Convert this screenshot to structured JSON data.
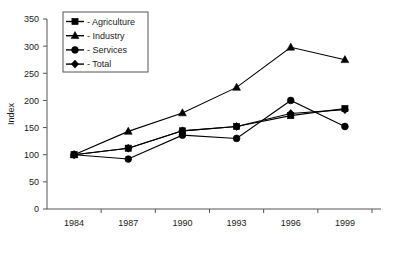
{
  "chart_data": {
    "type": "line",
    "title": "",
    "subtitle": "",
    "xlabel": "",
    "ylabel": "Index",
    "categories": [
      "1984",
      "1987",
      "1990",
      "1993",
      "1996",
      "1999"
    ],
    "x": [
      1984,
      1987,
      1990,
      1993,
      1996,
      1999
    ],
    "ylim": [
      0,
      350
    ],
    "yticks": [
      0,
      50,
      100,
      150,
      200,
      250,
      300,
      350
    ],
    "ytick_labels": [
      "0",
      "50",
      "100",
      "150",
      "200",
      "250",
      "300",
      "350"
    ],
    "grid": false,
    "legend_position": "top-left",
    "series": [
      {
        "name": "Agriculture",
        "legend_label": "- Agriculture",
        "marker": "square",
        "color": "#000000",
        "values": [
          100,
          112,
          144,
          152,
          172,
          185
        ]
      },
      {
        "name": "Industry",
        "legend_label": "- Industry",
        "marker": "triangle",
        "color": "#000000",
        "values": [
          100,
          143,
          177,
          224,
          298,
          275
        ]
      },
      {
        "name": "Services",
        "legend_label": "- Services",
        "marker": "circle",
        "color": "#000000",
        "values": [
          100,
          92,
          136,
          130,
          200,
          152
        ]
      },
      {
        "name": "Total",
        "legend_label": "- Total",
        "marker": "diamond",
        "color": "#000000",
        "values": [
          100,
          112,
          144,
          152,
          176,
          183
        ]
      }
    ]
  }
}
